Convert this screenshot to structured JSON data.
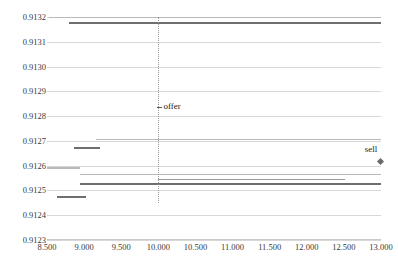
{
  "chart_data": {
    "type": "line",
    "title": "",
    "xlabel": "",
    "ylabel": "",
    "xlim": [
      8.5,
      13.0
    ],
    "ylim": [
      0.9123,
      0.9132
    ],
    "grid": true,
    "legend": "none",
    "xticks": [
      "8.500",
      "9.000",
      "9.500",
      "10.000",
      "10.500",
      "11.000",
      "11.500",
      "12.000",
      "12.500",
      "13.000"
    ],
    "xtick_values": [
      8.5,
      9.0,
      9.5,
      10.0,
      10.5,
      11.0,
      11.5,
      12.0,
      12.5,
      13.0
    ],
    "yticks": [
      "0.9123",
      "0.9124",
      "0.9125",
      "0.9126",
      "0.9127",
      "0.9128",
      "0.9129",
      "0.9130",
      "0.9131",
      "0.9132"
    ],
    "ytick_values": [
      0.9123,
      0.9124,
      0.9125,
      0.9126,
      0.9127,
      0.9128,
      0.9129,
      0.913,
      0.9131,
      0.9132
    ],
    "series": [
      {
        "name": "ask-top-light",
        "color": "#b9b9b9",
        "width": 1,
        "segments": [
          {
            "x0": 8.53,
            "x1": 13.0,
            "y": 0.9132
          }
        ]
      },
      {
        "name": "ask-top-dark",
        "color": "#6e6e6e",
        "width": 2,
        "segments": [
          {
            "x0": 8.79,
            "x1": 13.0,
            "y": 0.913175
          }
        ]
      },
      {
        "name": "mid-light-0.9127",
        "color": "#b9b9b9",
        "width": 1,
        "segments": [
          {
            "x0": 9.16,
            "x1": 13.0,
            "y": 0.912705
          }
        ]
      },
      {
        "name": "short-dark-0.91267",
        "color": "#6e6e6e",
        "width": 2,
        "segments": [
          {
            "x0": 8.86,
            "x1": 9.22,
            "y": 0.912672
          }
        ]
      },
      {
        "name": "bid-light-0.91259",
        "color": "#b9b9b9",
        "width": 2,
        "segments": [
          {
            "x0": 8.5,
            "x1": 8.94,
            "y": 0.912592
          }
        ]
      },
      {
        "name": "bid-light-0.912565",
        "color": "#b9b9b9",
        "width": 1,
        "segments": [
          {
            "x0": 8.94,
            "x1": 13.0,
            "y": 0.912565
          }
        ]
      },
      {
        "name": "bid-dark-0.912528",
        "color": "#6e6e6e",
        "width": 2,
        "segments": [
          {
            "x0": 8.94,
            "x1": 13.0,
            "y": 0.912528
          }
        ]
      },
      {
        "name": "bid-mid-0.912535-right",
        "color": "#9a9a9a",
        "width": 1,
        "segments": [
          {
            "x0": 10.0,
            "x1": 12.52,
            "y": 0.912545
          }
        ]
      },
      {
        "name": "bid-dark-0.912475",
        "color": "#6e6e6e",
        "width": 2,
        "segments": [
          {
            "x0": 8.63,
            "x1": 9.03,
            "y": 0.912475
          }
        ]
      }
    ],
    "vertical_line": {
      "x": 10.0,
      "y_top": 0.9132,
      "y_bottom": 0.91245,
      "style": "dotted"
    },
    "annotations": [
      {
        "label": "offer",
        "x": 10.07,
        "y": 0.912835,
        "marker": "tick"
      },
      {
        "label": "sell",
        "x": 12.97,
        "y": 0.912665,
        "marker": "diamond",
        "marker_x": 13.0,
        "marker_y": 0.912615
      }
    ]
  },
  "colors": {
    "grid": "#d8d8d8",
    "light_line": "#b9b9b9",
    "dark_line": "#6e6e6e",
    "text": "#3a3a3a",
    "background": "#ffffff"
  }
}
